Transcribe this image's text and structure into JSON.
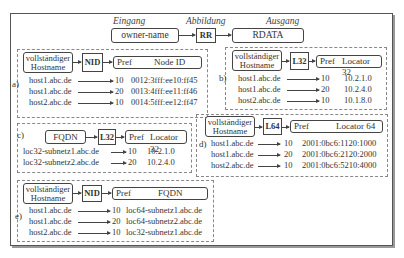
{
  "header": {
    "input_label": "Eingang",
    "mapping_label": "Abbildung",
    "output_label": "Ausgang",
    "input_box": "owner-name",
    "mapping_box": "RR",
    "output_box": "RDATA"
  },
  "sections": {
    "a": {
      "tag": "a)",
      "source": [
        "vollständiger",
        "Hostname"
      ],
      "rr": "NID",
      "pref": "Pref",
      "field": "Node ID",
      "rows": [
        {
          "name": "host1.abc.de",
          "pref": "10",
          "value": "0012:3fff:ee10:ff45"
        },
        {
          "name": "host1.abc.de",
          "pref": "20",
          "value": "0013:4fff:ee11:ff46"
        },
        {
          "name": "host2.abc.de",
          "pref": "10",
          "value": "0014:5fff:ee12:ff47"
        }
      ]
    },
    "b": {
      "tag": "b)",
      "source": [
        "vollständiger",
        "Hostname"
      ],
      "rr": "L32",
      "pref": "Pref",
      "field": "Locator 32",
      "rows": [
        {
          "name": "host1.abc.de",
          "pref": "10",
          "value": "10.2.1.0"
        },
        {
          "name": "host1.abc.de",
          "pref": "20",
          "value": "10.2.4.0"
        },
        {
          "name": "host2.abc.de",
          "pref": "10",
          "value": "10.1.8.0"
        }
      ]
    },
    "c": {
      "tag": "c)",
      "source": [
        "FQDN"
      ],
      "rr": "L32",
      "pref": "Pref",
      "field": "Locator 32",
      "rows": [
        {
          "name": "loc32-subnetz1.abc.de",
          "pref": "10",
          "value": "10.2.1.0"
        },
        {
          "name": "loc32-subnetz2.abc.de",
          "pref": "20",
          "value": "10.2.4.0"
        }
      ]
    },
    "d": {
      "tag": "d)",
      "source": [
        "vollständiger",
        "Hostname"
      ],
      "rr": "L64",
      "pref": "Pref",
      "field": "Locator 64",
      "rows": [
        {
          "name": "host1.abc.de",
          "pref": "10",
          "value": "2001:0bc6:1120:1000"
        },
        {
          "name": "host1.abc.de",
          "pref": "20",
          "value": "2001:0bc6:2120:2000"
        },
        {
          "name": "host2.abc.de",
          "pref": "10",
          "value": "2001:0bc6:5210:4000"
        }
      ]
    },
    "e": {
      "tag": "e)",
      "source": [
        "vollständiger",
        "Hostname"
      ],
      "rr": "NID",
      "pref": "Pref",
      "field": "FQDN",
      "rows": [
        {
          "name": "host1.abc.de",
          "pref": "10",
          "value": "loc64-subnetz1.abc.de"
        },
        {
          "name": "host1.abc.de",
          "pref": "20",
          "value": "loc64-subnetz2.abc.de"
        },
        {
          "name": "host2.abc.de",
          "pref": "10",
          "value": "loc32-subnetz1.abc.de"
        }
      ]
    }
  }
}
